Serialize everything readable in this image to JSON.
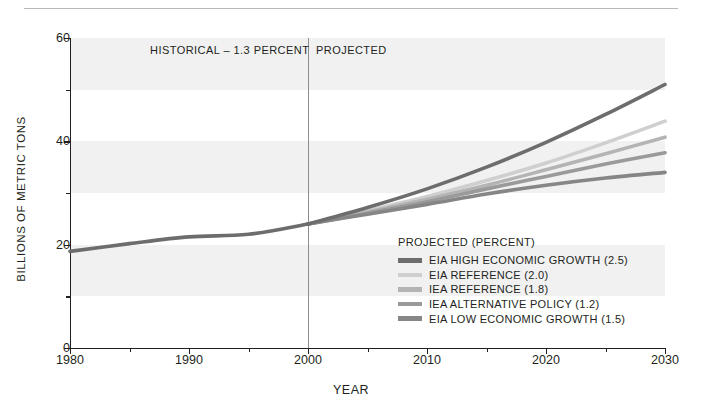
{
  "top_rule": true,
  "axis": {
    "y_title": "BILLIONS OF METRIC TONS",
    "x_title": "YEAR",
    "y_ticks": [
      "0",
      "20",
      "40",
      "60"
    ],
    "y_minor_ticks": [
      "10",
      "30",
      "50"
    ],
    "x_ticks": [
      "1980",
      "1990",
      "2000",
      "2010",
      "2020",
      "2030"
    ],
    "x_minor_ticks": [
      "1985",
      "1995",
      "2005",
      "2015",
      "2025"
    ]
  },
  "annotations": {
    "historical": "HISTORICAL – 1.3 PERCENT",
    "projected": "PROJECTED"
  },
  "legend": {
    "title": "PROJECTED (PERCENT)",
    "entries": [
      {
        "label": "EIA HIGH ECONOMIC GROWTH (2.5)",
        "color": "#6d6d6d"
      },
      {
        "label": "EIA REFERENCE (2.0)",
        "color": "#cfcfcf"
      },
      {
        "label": "IEA REFERENCE (1.8)",
        "color": "#b4b4b4"
      },
      {
        "label": "IEA ALTERNATIVE POLICY (1.2)",
        "color": "#9a9a9a"
      },
      {
        "label": "EIA LOW ECONOMIC GROWTH (1.5)",
        "color": "#868686"
      }
    ]
  },
  "chart_data": {
    "type": "line",
    "title": "",
    "xlabel": "YEAR",
    "ylabel": "BILLIONS OF METRIC TONS",
    "xlim": [
      1980,
      2030
    ],
    "ylim": [
      0,
      60
    ],
    "grid": false,
    "background_bands": [
      [
        10,
        20
      ],
      [
        30,
        40
      ],
      [
        50,
        60
      ]
    ],
    "legend_position": "inside-lower-right",
    "divider_x": 2000,
    "historical": {
      "label": "HISTORICAL – 1.3 PERCENT",
      "growth_percent": 1.3,
      "color": "#6d6d6d",
      "x": [
        1980,
        1985,
        1990,
        1995,
        2000
      ],
      "y": [
        18.7,
        20.2,
        21.5,
        22.0,
        24.0
      ]
    },
    "series": [
      {
        "name": "EIA HIGH ECONOMIC GROWTH (2.5)",
        "growth_percent": 2.5,
        "color": "#6d6d6d",
        "x": [
          2000,
          2005,
          2010,
          2015,
          2020,
          2025,
          2030
        ],
        "y": [
          24.0,
          27.2,
          30.8,
          35.0,
          39.8,
          45.2,
          51.0
        ]
      },
      {
        "name": "EIA REFERENCE (2.0)",
        "growth_percent": 2.0,
        "color": "#cfcfcf",
        "x": [
          2000,
          2005,
          2010,
          2015,
          2020,
          2025,
          2030
        ],
        "y": [
          24.0,
          26.6,
          29.3,
          32.4,
          35.8,
          39.7,
          43.9
        ]
      },
      {
        "name": "IEA REFERENCE (1.8)",
        "growth_percent": 1.8,
        "color": "#b4b4b4",
        "x": [
          2000,
          2005,
          2010,
          2015,
          2020,
          2025,
          2030
        ],
        "y": [
          24.0,
          26.3,
          28.8,
          31.5,
          34.5,
          37.6,
          40.8
        ]
      },
      {
        "name": "IEA ALTERNATIVE POLICY (1.2)",
        "growth_percent": 1.2,
        "color": "#9a9a9a",
        "x": [
          2000,
          2005,
          2010,
          2015,
          2020,
          2025,
          2030
        ],
        "y": [
          24.0,
          26.1,
          28.3,
          30.8,
          33.2,
          35.6,
          37.8
        ]
      },
      {
        "name": "EIA LOW ECONOMIC GROWTH (1.5)",
        "growth_percent": 1.5,
        "color": "#868686",
        "x": [
          2000,
          2005,
          2010,
          2015,
          2020,
          2025,
          2030
        ],
        "y": [
          24.0,
          25.9,
          27.8,
          29.8,
          31.5,
          32.9,
          34.0
        ]
      }
    ]
  }
}
